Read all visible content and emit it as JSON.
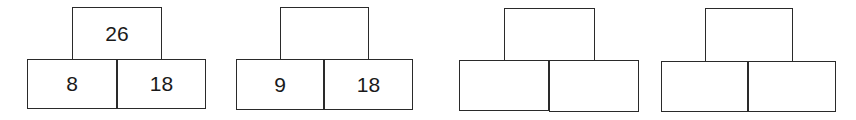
{
  "pyramids": [
    {
      "top": "26",
      "bottom_left": "8",
      "bottom_right": "18",
      "geom": {
        "top_x": 72,
        "top_y": 7,
        "top_w": 90,
        "h": 52,
        "bl_x": 27,
        "br_x": 117,
        "bw": 89,
        "bottom_y": 59,
        "bh": 50
      }
    },
    {
      "top": "",
      "bottom_left": "9",
      "bottom_right": "18",
      "geom": {
        "top_x": 280,
        "top_y": 7,
        "top_w": 88,
        "h": 52,
        "bl_x": 236,
        "br_x": 324,
        "bw": 88,
        "bottom_y": 59,
        "bh": 51
      }
    },
    {
      "top": "",
      "bottom_left": "",
      "bottom_right": "",
      "geom": {
        "top_x": 504,
        "top_y": 8,
        "top_w": 90,
        "h": 52,
        "bl_x": 459,
        "br_x": 549,
        "bw": 90,
        "bottom_y": 60,
        "bh": 51
      }
    },
    {
      "top": "",
      "bottom_left": "",
      "bottom_right": "",
      "geom": {
        "top_x": 705,
        "top_y": 8,
        "top_w": 87,
        "h": 53,
        "bl_x": 661,
        "br_x": 748,
        "bw": 87,
        "bottom_y": 61,
        "bh": 51
      }
    }
  ]
}
